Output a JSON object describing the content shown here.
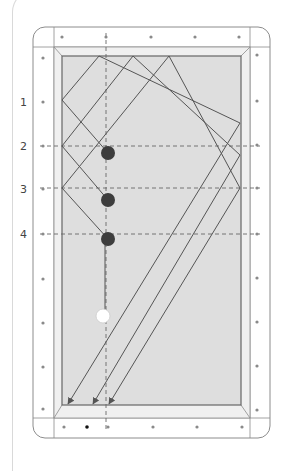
{
  "diagram": {
    "type": "billiards-table-diamond-system",
    "colors": {
      "frame_stroke": "#8c8c8c",
      "rail_fill": "#ffffff",
      "cushion_fill": "#f0f0f0",
      "felt_fill": "#dedede",
      "path_stroke": "#555555",
      "guide_dash": "#666666",
      "object_ball": "#3d3d3d",
      "cue_ball": "#ffffff",
      "diamond": "#8a8a8a",
      "marked_diamond": "#111111"
    },
    "row_labels": [
      {
        "text": "1",
        "y": 102
      },
      {
        "text": "2",
        "y": 146
      },
      {
        "text": "3",
        "y": 189
      },
      {
        "text": "4",
        "y": 234
      }
    ],
    "object_balls": [
      {
        "label": "2",
        "x": 108,
        "y": 153
      },
      {
        "label": "3",
        "x": 108,
        "y": 200
      },
      {
        "label": "4",
        "x": 108,
        "y": 239
      }
    ],
    "cue_ball": {
      "x": 103,
      "y": 316
    },
    "paths": [
      {
        "from_ball": "2",
        "points": [
          [
            108,
            153
          ],
          [
            62,
            100
          ],
          [
            99,
            56
          ],
          [
            240,
            123
          ],
          [
            68,
            404
          ]
        ]
      },
      {
        "from_ball": "3",
        "points": [
          [
            108,
            200
          ],
          [
            62,
            146
          ],
          [
            133,
            56
          ],
          [
            240,
            155
          ],
          [
            93,
            404
          ]
        ]
      },
      {
        "from_ball": "4",
        "points": [
          [
            108,
            239
          ],
          [
            62,
            188
          ],
          [
            169,
            56
          ],
          [
            240,
            188
          ],
          [
            109,
            404
          ]
        ]
      }
    ],
    "guide_lines_y": [
      146,
      188,
      234
    ],
    "guide_line_x": 106,
    "diamonds_left": [
      58,
      102,
      146,
      189,
      234,
      279,
      323,
      367,
      409
    ],
    "diamonds_right": [
      55,
      101,
      145,
      188,
      234,
      278,
      322,
      366,
      410
    ],
    "diamonds_top": [
      62,
      106,
      151,
      195,
      239
    ],
    "diamonds_bottom": [
      64,
      87,
      108,
      153,
      197,
      242
    ],
    "marked_bottom_diamond_x": 87
  }
}
